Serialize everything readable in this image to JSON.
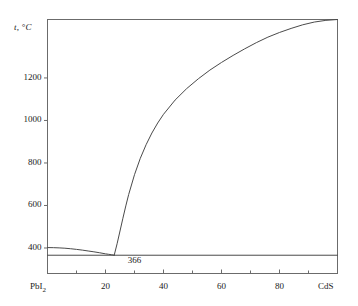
{
  "chart_data": {
    "type": "line",
    "title": "",
    "subtitle": "",
    "xlabel": "",
    "ylabel": "t, °C",
    "ylabel_symbol": "t",
    "ylabel_unit": ", °C",
    "xlim": [
      0,
      100
    ],
    "ylim": [
      280,
      1475
    ],
    "grid": false,
    "legend": null,
    "x_tick_labels": [
      "PbI2",
      "20",
      "40",
      "60",
      "80",
      "CdS"
    ],
    "x_tick_values": [
      0,
      20,
      40,
      60,
      80,
      100
    ],
    "x_minor_tick_values": [
      10,
      30,
      50,
      70,
      90
    ],
    "y_tick_labels": [
      "400",
      "600",
      "800",
      "1000",
      "1200"
    ],
    "y_tick_values": [
      400,
      600,
      800,
      1000,
      1200
    ],
    "left_endmember": "PbI",
    "left_endmember_sub": "2",
    "right_endmember": "CdS",
    "annotations": [
      {
        "text": "366",
        "x": 30,
        "y": 340,
        "meaning": "eutectic-horizontal-temperature"
      }
    ],
    "series": [
      {
        "name": "left-liquidus",
        "points": [
          [
            0,
            402
          ],
          [
            2,
            401.5
          ],
          [
            4,
            400.5
          ],
          [
            6,
            399
          ],
          [
            8,
            396.5
          ],
          [
            10,
            393.5
          ],
          [
            12,
            390
          ],
          [
            14,
            386
          ],
          [
            16,
            382
          ],
          [
            18,
            377.5
          ],
          [
            20,
            372.5
          ],
          [
            21,
            370.5
          ],
          [
            22,
            368.5
          ],
          [
            23,
            366
          ]
        ]
      },
      {
        "name": "right-liquidus",
        "points": [
          [
            23,
            366
          ],
          [
            24,
            420
          ],
          [
            25,
            480
          ],
          [
            26,
            540
          ],
          [
            27,
            598
          ],
          [
            28,
            652
          ],
          [
            30,
            745
          ],
          [
            32,
            822
          ],
          [
            34,
            886
          ],
          [
            36,
            941
          ],
          [
            38,
            988
          ],
          [
            40,
            1029
          ],
          [
            44,
            1096
          ],
          [
            48,
            1150
          ],
          [
            52,
            1196
          ],
          [
            56,
            1237
          ],
          [
            60,
            1273
          ],
          [
            64,
            1306
          ],
          [
            68,
            1337
          ],
          [
            72,
            1366
          ],
          [
            76,
            1392
          ],
          [
            80,
            1414
          ],
          [
            84,
            1433
          ],
          [
            88,
            1450
          ],
          [
            92,
            1463
          ],
          [
            96,
            1471
          ],
          [
            100,
            1475
          ]
        ]
      },
      {
        "name": "eutectic-horizontal",
        "points": [
          [
            0,
            366
          ],
          [
            100,
            366
          ]
        ]
      }
    ]
  },
  "colors": {
    "curve": "#4a4a4a",
    "frame": "#6b6b6b",
    "text": "#1a1a1a",
    "background": "#ffffff"
  }
}
